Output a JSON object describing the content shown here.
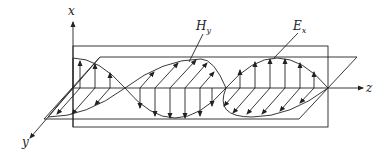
{
  "figure": {
    "axes": {
      "x_label": "x",
      "y_label": "y",
      "z_label": "z"
    },
    "annotations": {
      "h_field_main": "H",
      "h_field_sub": "y",
      "e_field_main": "E",
      "e_field_sub": "x"
    },
    "colors": {
      "ink": "#222222",
      "background": "#ffffff"
    }
  }
}
